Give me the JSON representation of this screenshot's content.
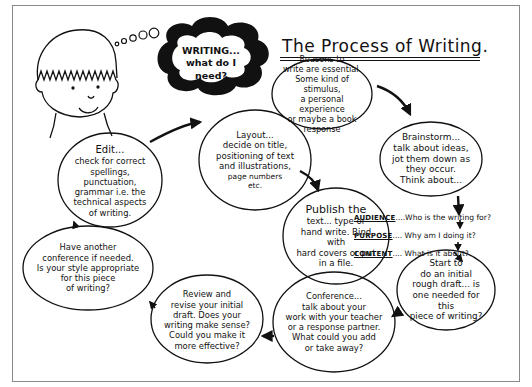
{
  "title": "The Process of Writing.",
  "thought_bubble": {
    "line1": "WRITING...",
    "line2": "what do I need?"
  },
  "nodes": {
    "reasons": [
      "Reasons to",
      "write are essential.",
      "Some kind of stimulus,",
      "a personal experience",
      "or maybe a book",
      "response"
    ],
    "brainstorm": [
      "Brainstorm...",
      "talk about ideas,",
      "jot them down as",
      "they occur.",
      "Think about..."
    ],
    "draft": [
      "Start to",
      "do an initial",
      "rough draft... is",
      "one needed for this",
      "piece of writing?"
    ],
    "conference": [
      "Conference...",
      "talk about your",
      "work with your teacher",
      "or a response partner.",
      "What could you add",
      "or take away?"
    ],
    "review": [
      "Review and",
      "revise your initial",
      "draft. Does your",
      "writing make sense?",
      "Could you make it",
      "more effective?"
    ],
    "another_conference": [
      "Have another",
      "conference if needed.",
      "Is your style appropriate",
      "for this piece",
      "of writing?"
    ],
    "edit": [
      "Edit...",
      "check for correct",
      "spellings, punctuation,",
      "grammar i.e. the",
      "technical aspects",
      "of writing."
    ],
    "layout": [
      "Layout...",
      "decide on title,",
      "positioning of text",
      "and illustrations,",
      "page numbers",
      "etc."
    ],
    "publish": [
      "Publish the",
      "text... type or",
      "hand write. Bind with",
      "hard covers or put",
      "in a file."
    ]
  },
  "think_about": [
    {
      "label": "AUDIENCE",
      "text": "....Who is the writing for?"
    },
    {
      "label": "PURPOSE",
      "text": ".... Why am I doing it?"
    },
    {
      "label": "CONTENT",
      "text": ".... What is it about?"
    }
  ]
}
